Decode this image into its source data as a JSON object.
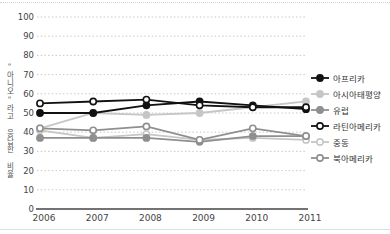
{
  "chart_data": {
    "type": "line",
    "title": "",
    "ylabel": "\"아니오\"라고 응답한 비율",
    "xlabel": "",
    "categories": [
      "2006",
      "2007",
      "2008",
      "2009",
      "2010",
      "2011"
    ],
    "series": [
      {
        "name": "아프리카",
        "color": "#111111",
        "marker": "filled",
        "values": [
          50,
          50,
          54,
          56,
          54,
          52
        ]
      },
      {
        "name": "아시아태평양",
        "color": "#c6c6c6",
        "marker": "filled",
        "values": [
          42,
          50,
          49,
          50,
          53,
          56
        ]
      },
      {
        "name": "유럽",
        "color": "#8f8f8f",
        "marker": "filled",
        "values": [
          37,
          37,
          37,
          35,
          38,
          38
        ]
      },
      {
        "name": "라틴아메리카",
        "color": "#111111",
        "marker": "open",
        "values": [
          55,
          56,
          57,
          54,
          53,
          53
        ]
      },
      {
        "name": "중동",
        "color": "#c6c6c6",
        "marker": "open",
        "values": [
          41,
          37,
          39,
          36,
          37,
          36
        ]
      },
      {
        "name": "북아메리카",
        "color": "#8f8f8f",
        "marker": "open",
        "values": [
          42,
          41,
          43,
          36,
          42,
          38
        ]
      }
    ],
    "ylim": [
      0,
      100
    ],
    "ytick_step": 10,
    "yticks": [
      0,
      10,
      20,
      30,
      40,
      50,
      60,
      70,
      80,
      90,
      100
    ],
    "grid": "dotted-horizontal",
    "legend_position": "right",
    "axis_color": "#444444",
    "grid_color": "#c9c9c9",
    "tick_label_color": "#444444"
  }
}
